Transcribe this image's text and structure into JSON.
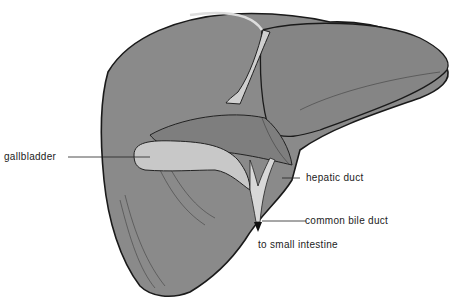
{
  "diagram": {
    "colors": {
      "liver": "#8a8a8a",
      "outline": "#1a1a1a",
      "gallbladder": "#c8c8c8",
      "duct": "#d8d8d8"
    },
    "labels": [
      {
        "id": "gallbladder",
        "text": "gallbladder"
      },
      {
        "id": "hepatic_duct",
        "text": "hepatic duct"
      },
      {
        "id": "common_bile_duct",
        "text": "common bile duct"
      },
      {
        "id": "to_small_intestine",
        "text": "to small intestine"
      }
    ]
  }
}
